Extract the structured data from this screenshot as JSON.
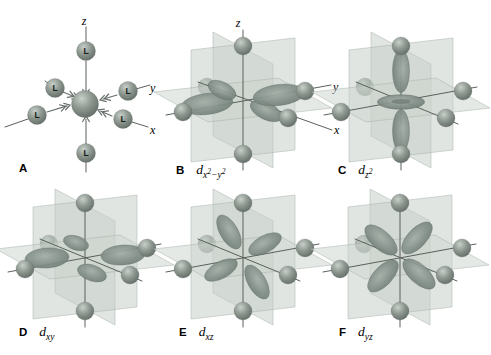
{
  "panels": [
    {
      "letter": "A",
      "scene": "ligands",
      "caption": null
    },
    {
      "letter": "B",
      "scene": "dx2y2",
      "caption": {
        "base": "d",
        "script": [
          {
            "t": "x"
          },
          {
            "t": "2",
            "sup": true
          },
          {
            "t": "−"
          },
          {
            "t": "y"
          },
          {
            "t": "2",
            "sup": true
          }
        ]
      }
    },
    {
      "letter": "C",
      "scene": "dz2",
      "caption": {
        "base": "d",
        "script": [
          {
            "t": "z"
          },
          {
            "t": "2",
            "sup": true
          }
        ]
      }
    },
    {
      "letter": "D",
      "scene": "dxy",
      "caption": {
        "base": "d",
        "script": [
          {
            "t": "xy"
          }
        ]
      }
    },
    {
      "letter": "E",
      "scene": "dxz",
      "caption": {
        "base": "d",
        "script": [
          {
            "t": "xz"
          }
        ]
      }
    },
    {
      "letter": "F",
      "scene": "dyz",
      "caption": {
        "base": "d",
        "script": [
          {
            "t": "yz"
          }
        ]
      }
    }
  ],
  "axis_labels": {
    "z": "z",
    "y": "y",
    "x": "x"
  },
  "ligand_label": "L",
  "colors": {
    "background": "#ffffff",
    "sphere_highlight": "#c9cfca",
    "sphere_mid": "#8f9992",
    "sphere_shadow": "#5d6761",
    "lobe_light": "#a3aea7",
    "lobe_mid": "#828f88",
    "lobe_dark": "#68756e",
    "lobe_outline": "#5e6a64",
    "plane_fill_horizontal": "#ced5cf",
    "plane_fill_vertical": "#c6cdc7",
    "plane_edge": "#a9b1aa",
    "axis_line": "#5a615c",
    "arrow": "#666e69",
    "label_text": "#111111"
  }
}
